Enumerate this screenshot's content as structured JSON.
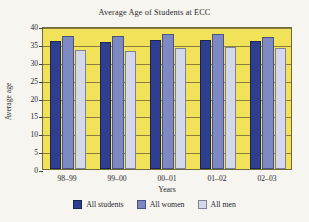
{
  "chart_data": {
    "type": "bar",
    "title": "Average Age of Students at ECC",
    "xlabel": "Years",
    "ylabel": "Average age",
    "categories": [
      "98–99",
      "99–00",
      "00–01",
      "01–02",
      "02–03"
    ],
    "series": [
      {
        "name": "All students",
        "color": "#2f3f8f",
        "values": [
          35.7,
          35.6,
          36.0,
          36.0,
          35.8
        ]
      },
      {
        "name": "All women",
        "color": "#7e89c4",
        "values": [
          37.2,
          37.1,
          37.9,
          37.8,
          37.0
        ]
      },
      {
        "name": "All men",
        "color": "#d3d8ea",
        "values": [
          33.3,
          33.1,
          33.9,
          34.2,
          33.8
        ]
      }
    ],
    "ylim": [
      0,
      40
    ],
    "yticks": [
      0,
      5,
      10,
      15,
      20,
      25,
      30,
      35,
      40
    ],
    "ytick_labels": [
      "0",
      "5",
      "10",
      "15",
      "20",
      "25",
      "30",
      "35",
      "40"
    ],
    "grid": true,
    "legend_position": "bottom",
    "plot_background": "#f2e259",
    "figure_background": "#f7f5ef"
  }
}
